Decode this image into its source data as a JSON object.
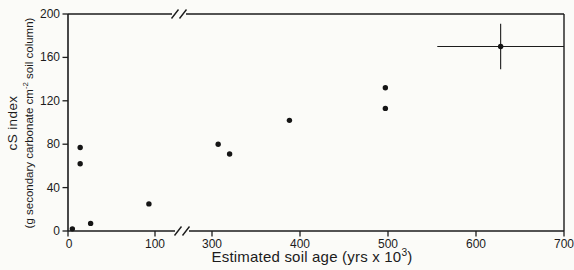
{
  "figure": {
    "background_color": "#fbfbf8",
    "ink_color": "#1c1c1c"
  },
  "chart_data": {
    "type": "scatter",
    "title": "",
    "xlabel": {
      "pre": "Estimated soil age (yrs x 10",
      "sup": "3",
      "post": ")"
    },
    "ylabel": {
      "line1": "cS index",
      "line2_pre": "(g secondary carbonate cm",
      "line2_sup": "-2",
      "line2_post": " soil column)"
    },
    "x_ticks": [
      0,
      100,
      300,
      400,
      500,
      600,
      700
    ],
    "y_ticks": [
      0,
      40,
      80,
      120,
      160,
      200
    ],
    "xlim": [
      0,
      700
    ],
    "ylim": [
      0,
      200
    ],
    "x_axis_break": {
      "between": [
        100,
        300
      ]
    },
    "grid": false,
    "legend": "none",
    "marker": "filled-circle",
    "points": [
      {
        "x": 5,
        "y": 2
      },
      {
        "x": 14,
        "y": 77
      },
      {
        "x": 14,
        "y": 62
      },
      {
        "x": 26,
        "y": 7
      },
      {
        "x": 93,
        "y": 25
      },
      {
        "x": 307,
        "y": 80
      },
      {
        "x": 320,
        "y": 71
      },
      {
        "x": 388,
        "y": 102
      },
      {
        "x": 497,
        "y": 113
      },
      {
        "x": 497,
        "y": 132
      },
      {
        "x": 628,
        "y": 170,
        "xerr": 72,
        "yerr": 21
      }
    ]
  }
}
